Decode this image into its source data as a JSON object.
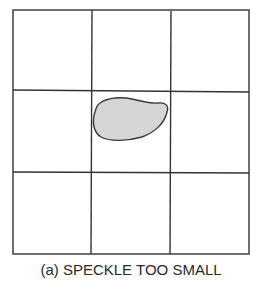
{
  "figure": {
    "caption": "(a) SPECKLE TOO SMALL",
    "grid": {
      "rows": 3,
      "cols": 3
    },
    "speckle": {
      "cell_row": 2,
      "cell_col": 2,
      "description": "irregular blob smaller than grid cell"
    },
    "colors": {
      "line": "#333333",
      "speckle_fill": "#d6d6d6",
      "speckle_stroke": "#3a3a3a",
      "background": "#ffffff"
    }
  }
}
